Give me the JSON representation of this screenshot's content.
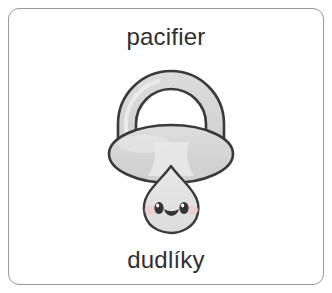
{
  "card": {
    "term_english": "pacifier",
    "term_translation": "dudlíky",
    "border_color": "#9a9a9a",
    "background_color": "#ffffff",
    "text_color": "#2f2f2f"
  },
  "illustration": {
    "name": "pacifier-illustration",
    "parts": [
      "ring-handle",
      "shield",
      "nipple",
      "face"
    ],
    "face": {
      "eyes": 2,
      "mouth": "smile",
      "blush": true
    },
    "colors": {
      "outline": "#3a3a3a",
      "body_fill": "#d6d6d6",
      "highlight_fill": "#ececec",
      "nipple_fill": "#e3e3e3",
      "blush": "#f0c9cf",
      "eye": "#333333"
    }
  }
}
